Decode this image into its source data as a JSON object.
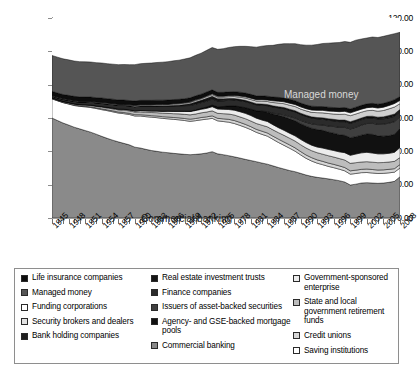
{
  "chart_data": {
    "type": "area",
    "title": "",
    "xlabel": "",
    "ylabel": "",
    "ylim": [
      0,
      120
    ],
    "yticks": [
      "0.00",
      "20.00",
      "40.00",
      "60.00",
      "80.00",
      "100.00",
      "120.00"
    ],
    "grid": false,
    "legend_position": "bottom",
    "stacked": true,
    "x_start": 1945,
    "x_end": 2008,
    "x_tick_step": 3,
    "x_tick_labels": [
      "1945",
      "1948",
      "1951",
      "1954",
      "1957",
      "1960",
      "1963",
      "1966",
      "1969",
      "1972",
      "1975",
      "1978",
      "1981",
      "1984",
      "1987",
      "1990",
      "1993",
      "1996",
      "1999",
      "2002",
      "2005",
      "2008"
    ],
    "x": [
      1945,
      1946,
      1947,
      1948,
      1949,
      1950,
      1951,
      1952,
      1953,
      1954,
      1955,
      1956,
      1957,
      1958,
      1959,
      1960,
      1961,
      1962,
      1963,
      1964,
      1965,
      1966,
      1967,
      1968,
      1969,
      1970,
      1971,
      1972,
      1973,
      1974,
      1975,
      1976,
      1977,
      1978,
      1979,
      1980,
      1981,
      1982,
      1983,
      1984,
      1985,
      1986,
      1987,
      1988,
      1989,
      1990,
      1991,
      1992,
      1993,
      1994,
      1995,
      1996,
      1997,
      1998,
      1999,
      2000,
      2001,
      2002,
      2003,
      2004,
      2005,
      2006,
      2007,
      2008
    ],
    "annotations": [
      {
        "name": "managed-money-label",
        "text": "Managed money"
      },
      {
        "name": "commercial-banking-label",
        "text": "Commercial banking"
      }
    ],
    "series": [
      {
        "name": "Commercial banking",
        "swatch": "#8a8a8a",
        "values": [
          60.0,
          58.5,
          57.0,
          55.8,
          54.5,
          53.5,
          52.5,
          51.5,
          50.3,
          49.0,
          47.8,
          46.7,
          45.7,
          44.8,
          43.9,
          42.5,
          42.0,
          41.2,
          40.5,
          40.0,
          39.5,
          39.2,
          38.8,
          38.5,
          38.2,
          38.0,
          38.2,
          38.5,
          39.0,
          39.8,
          38.5,
          38.0,
          37.4,
          36.7,
          36.0,
          35.2,
          34.5,
          33.8,
          33.0,
          32.3,
          31.3,
          30.3,
          29.4,
          28.5,
          27.8,
          26.8,
          25.8,
          25.0,
          24.4,
          24.0,
          23.5,
          23.0,
          22.4,
          21.6,
          19.8,
          20.3,
          21.0,
          21.2,
          21.0,
          20.8,
          21.0,
          21.4,
          22.0,
          24.8
        ]
      },
      {
        "name": "Saving institutions",
        "swatch": "#ffffff",
        "values": [
          11.5,
          11.8,
          12.2,
          12.6,
          13.0,
          13.5,
          14.2,
          14.8,
          15.4,
          16.0,
          16.6,
          17.0,
          17.3,
          17.8,
          18.2,
          18.7,
          19.2,
          19.6,
          20.0,
          20.2,
          20.3,
          20.3,
          20.4,
          20.4,
          20.3,
          20.0,
          20.2,
          20.4,
          20.3,
          20.0,
          19.8,
          19.9,
          20.1,
          20.0,
          19.6,
          19.2,
          18.5,
          17.6,
          17.2,
          16.8,
          15.9,
          15.0,
          14.2,
          13.4,
          12.3,
          11.1,
          10.0,
          9.2,
          8.5,
          8.0,
          7.5,
          7.2,
          6.9,
          6.7,
          6.5,
          6.4,
          6.2,
          6.1,
          6.0,
          5.9,
          5.8,
          5.7,
          5.5,
          5.2
        ]
      },
      {
        "name": "Credit unions",
        "swatch": "#d6d6d6",
        "values": [
          0.2,
          0.2,
          0.2,
          0.2,
          0.3,
          0.3,
          0.3,
          0.4,
          0.4,
          0.5,
          0.5,
          0.6,
          0.6,
          0.7,
          0.7,
          0.8,
          0.8,
          0.9,
          0.9,
          1.0,
          1.0,
          1.1,
          1.1,
          1.2,
          1.2,
          1.3,
          1.3,
          1.4,
          1.4,
          1.5,
          1.5,
          1.6,
          1.7,
          1.8,
          1.8,
          1.8,
          1.8,
          1.8,
          1.9,
          1.9,
          1.9,
          2.0,
          2.0,
          2.0,
          2.0,
          2.0,
          2.0,
          2.0,
          2.0,
          2.0,
          2.0,
          2.0,
          2.0,
          2.0,
          2.0,
          2.0,
          2.0,
          2.1,
          2.1,
          2.1,
          2.1,
          2.1,
          2.1,
          2.1
        ]
      },
      {
        "name": "State and local government retirement funds",
        "swatch": "#bdbdbd",
        "values": [
          0.4,
          0.4,
          0.5,
          0.5,
          0.6,
          0.6,
          0.7,
          0.8,
          0.9,
          1.0,
          1.1,
          1.2,
          1.3,
          1.4,
          1.5,
          1.6,
          1.7,
          1.8,
          1.9,
          2.0,
          2.1,
          2.2,
          2.3,
          2.4,
          2.5,
          2.6,
          2.7,
          2.8,
          2.9,
          3.0,
          3.0,
          3.1,
          3.2,
          3.3,
          3.3,
          3.4,
          3.4,
          3.5,
          3.6,
          3.7,
          3.8,
          3.9,
          4.0,
          4.0,
          4.1,
          4.1,
          4.2,
          4.2,
          4.3,
          4.3,
          4.4,
          4.4,
          4.4,
          4.5,
          4.5,
          4.5,
          4.4,
          4.4,
          4.4,
          4.4,
          4.4,
          4.4,
          4.4,
          4.2
        ]
      },
      {
        "name": "Government-sponsored enterprise",
        "swatch": "#ececec",
        "values": [
          0.1,
          0.1,
          0.1,
          0.2,
          0.2,
          0.2,
          0.3,
          0.3,
          0.3,
          0.4,
          0.4,
          0.5,
          0.5,
          0.6,
          0.6,
          0.7,
          0.8,
          0.9,
          1.0,
          1.1,
          1.2,
          1.4,
          1.5,
          1.6,
          1.8,
          2.0,
          2.1,
          2.1,
          2.2,
          2.5,
          2.6,
          2.6,
          2.7,
          2.9,
          3.1,
          3.2,
          3.3,
          3.2,
          3.1,
          3.2,
          3.1,
          3.0,
          3.0,
          3.0,
          3.1,
          3.2,
          3.3,
          3.3,
          3.4,
          3.7,
          3.8,
          3.9,
          4.0,
          4.4,
          4.8,
          5.2,
          5.5,
          5.6,
          5.5,
          5.3,
          5.2,
          5.2,
          5.4,
          6.0
        ]
      },
      {
        "name": "Agency- and GSE-backed mortgage pools",
        "swatch": "#111111",
        "values": [
          0.0,
          0.0,
          0.0,
          0.0,
          0.0,
          0.0,
          0.0,
          0.0,
          0.0,
          0.0,
          0.0,
          0.0,
          0.0,
          0.0,
          0.0,
          0.0,
          0.0,
          0.0,
          0.0,
          0.0,
          0.0,
          0.0,
          0.0,
          0.0,
          0.1,
          0.2,
          0.4,
          0.6,
          0.8,
          1.0,
          1.3,
          1.7,
          2.2,
          2.6,
          3.0,
          3.4,
          3.8,
          4.4,
          5.2,
          5.6,
          6.4,
          7.4,
          8.2,
          8.6,
          9.0,
          9.4,
          9.8,
          10.2,
          10.5,
          10.6,
          10.4,
          10.4,
          10.3,
          10.4,
          10.6,
          10.4,
          10.6,
          11.0,
          11.2,
          10.8,
          10.6,
          10.6,
          10.8,
          11.6
        ]
      },
      {
        "name": "Issuers of asset-backed securities",
        "swatch": "#3f3f3f",
        "values": [
          0.0,
          0.0,
          0.0,
          0.0,
          0.0,
          0.0,
          0.0,
          0.0,
          0.0,
          0.0,
          0.0,
          0.0,
          0.0,
          0.0,
          0.0,
          0.0,
          0.0,
          0.0,
          0.0,
          0.0,
          0.0,
          0.0,
          0.0,
          0.0,
          0.0,
          0.0,
          0.0,
          0.0,
          0.0,
          0.0,
          0.0,
          0.0,
          0.0,
          0.0,
          0.0,
          0.0,
          0.0,
          0.1,
          0.2,
          0.3,
          0.5,
          0.8,
          1.1,
          1.4,
          1.7,
          2.0,
          2.3,
          2.6,
          2.9,
          3.2,
          3.6,
          4.0,
          4.4,
          4.8,
          5.2,
          5.6,
          6.0,
          6.3,
          6.6,
          6.9,
          7.2,
          7.5,
          7.6,
          6.8
        ]
      },
      {
        "name": "Finance companies",
        "swatch": "#2b2b2b",
        "values": [
          1.0,
          1.1,
          1.2,
          1.3,
          1.4,
          1.5,
          1.6,
          1.7,
          1.8,
          1.9,
          2.0,
          2.1,
          2.2,
          2.3,
          2.4,
          2.5,
          2.6,
          2.7,
          2.8,
          2.9,
          3.0,
          3.0,
          3.1,
          3.2,
          3.3,
          3.4,
          3.4,
          3.4,
          3.5,
          3.6,
          3.5,
          3.4,
          3.4,
          3.5,
          3.6,
          3.6,
          3.6,
          3.5,
          3.5,
          3.6,
          3.7,
          3.7,
          3.7,
          3.7,
          3.7,
          3.6,
          3.6,
          3.5,
          3.5,
          3.5,
          3.5,
          3.4,
          3.4,
          3.4,
          3.4,
          3.4,
          3.3,
          3.3,
          3.2,
          3.2,
          3.2,
          3.2,
          3.2,
          3.2
        ]
      },
      {
        "name": "Real estate investment trusts",
        "swatch": "#151515",
        "values": [
          0.0,
          0.0,
          0.0,
          0.0,
          0.0,
          0.0,
          0.0,
          0.0,
          0.0,
          0.0,
          0.0,
          0.0,
          0.0,
          0.0,
          0.0,
          0.0,
          0.1,
          0.1,
          0.1,
          0.1,
          0.2,
          0.2,
          0.2,
          0.3,
          0.5,
          0.8,
          1.0,
          1.1,
          1.3,
          1.2,
          1.0,
          0.8,
          0.6,
          0.5,
          0.4,
          0.4,
          0.3,
          0.3,
          0.3,
          0.3,
          0.3,
          0.3,
          0.3,
          0.3,
          0.3,
          0.3,
          0.3,
          0.3,
          0.4,
          0.4,
          0.5,
          0.5,
          0.6,
          0.6,
          0.6,
          0.6,
          0.6,
          0.6,
          0.7,
          0.7,
          0.8,
          0.9,
          0.9,
          0.8
        ]
      },
      {
        "name": "Bank holding companies",
        "swatch": "#1f1f1f",
        "values": [
          0.0,
          0.0,
          0.0,
          0.0,
          0.0,
          0.0,
          0.0,
          0.0,
          0.0,
          0.0,
          0.0,
          0.0,
          0.0,
          0.0,
          0.0,
          0.0,
          0.0,
          0.0,
          0.0,
          0.0,
          0.0,
          0.0,
          0.1,
          0.1,
          0.2,
          0.3,
          0.3,
          0.3,
          0.4,
          0.4,
          0.4,
          0.4,
          0.4,
          0.4,
          0.4,
          0.4,
          0.4,
          0.4,
          0.4,
          0.4,
          0.4,
          0.4,
          0.4,
          0.4,
          0.4,
          0.4,
          0.4,
          0.4,
          0.4,
          0.4,
          0.4,
          0.4,
          0.4,
          0.4,
          0.4,
          0.4,
          0.4,
          0.4,
          0.4,
          0.4,
          0.4,
          0.5,
          0.5,
          0.5
        ]
      },
      {
        "name": "Security brokers and dealers",
        "swatch": "#cfcfcf",
        "values": [
          0.4,
          0.4,
          0.4,
          0.4,
          0.4,
          0.4,
          0.4,
          0.4,
          0.4,
          0.5,
          0.5,
          0.5,
          0.5,
          0.5,
          0.5,
          0.6,
          0.6,
          0.6,
          0.6,
          0.7,
          0.7,
          0.7,
          0.8,
          0.8,
          0.8,
          0.8,
          0.9,
          0.9,
          1.0,
          1.0,
          1.0,
          1.1,
          1.1,
          1.2,
          1.3,
          1.4,
          1.5,
          1.6,
          1.7,
          1.8,
          2.0,
          2.2,
          2.3,
          2.4,
          2.5,
          2.5,
          2.6,
          2.7,
          2.9,
          3.0,
          3.1,
          3.2,
          3.4,
          3.5,
          3.6,
          3.6,
          3.5,
          3.4,
          3.5,
          3.6,
          3.8,
          4.0,
          4.2,
          3.4
        ]
      },
      {
        "name": "Funding corporations",
        "swatch": "#f4f4f4",
        "values": [
          0.1,
          0.1,
          0.1,
          0.1,
          0.1,
          0.1,
          0.1,
          0.1,
          0.1,
          0.1,
          0.1,
          0.1,
          0.1,
          0.1,
          0.1,
          0.2,
          0.2,
          0.2,
          0.2,
          0.2,
          0.2,
          0.2,
          0.3,
          0.3,
          0.3,
          0.3,
          0.4,
          0.4,
          0.4,
          0.5,
          0.5,
          0.5,
          0.6,
          0.6,
          0.7,
          0.7,
          0.8,
          0.8,
          0.9,
          0.9,
          1.0,
          1.1,
          1.1,
          1.2,
          1.2,
          1.3,
          1.3,
          1.4,
          1.4,
          1.5,
          1.5,
          1.6,
          1.6,
          1.7,
          1.7,
          1.8,
          1.8,
          1.8,
          1.9,
          1.9,
          2.0,
          2.0,
          2.1,
          2.0
        ]
      },
      {
        "name": "Life insurance companies",
        "swatch": "#0d0d0d",
        "values": [
          2.3,
          2.4,
          2.4,
          2.5,
          2.5,
          2.6,
          2.6,
          2.6,
          2.6,
          2.6,
          2.6,
          2.6,
          2.6,
          2.6,
          2.6,
          2.6,
          2.6,
          2.6,
          2.6,
          2.5,
          2.5,
          2.5,
          2.5,
          2.4,
          2.4,
          2.4,
          2.4,
          2.4,
          2.4,
          2.4,
          2.3,
          2.3,
          2.3,
          2.3,
          2.3,
          2.3,
          2.3,
          2.3,
          2.3,
          2.3,
          2.3,
          2.3,
          2.3,
          2.3,
          2.3,
          2.3,
          2.3,
          2.3,
          2.3,
          2.3,
          2.3,
          2.3,
          2.3,
          2.3,
          2.3,
          2.3,
          2.3,
          2.3,
          2.3,
          2.3,
          2.3,
          2.3,
          2.3,
          2.3
        ]
      },
      {
        "name": "Managed money",
        "swatch": "#555555",
        "values": [
          21.5,
          21.5,
          21.4,
          21.3,
          21.2,
          21.1,
          21.0,
          21.0,
          21.0,
          21.0,
          21.0,
          21.0,
          21.2,
          21.3,
          21.5,
          21.8,
          22.0,
          22.2,
          22.4,
          22.6,
          22.8,
          23.0,
          23.2,
          23.5,
          23.8,
          24.0,
          24.3,
          24.6,
          25.0,
          25.4,
          25.8,
          26.2,
          26.6,
          27.0,
          27.5,
          28.0,
          28.6,
          29.2,
          29.8,
          30.4,
          31.0,
          31.8,
          32.6,
          33.4,
          34.2,
          35.0,
          35.8,
          36.6,
          37.2,
          37.8,
          38.4,
          38.8,
          39.2,
          39.6,
          40.0,
          40.2,
          39.8,
          39.5,
          39.8,
          40.0,
          40.2,
          40.0,
          39.6,
          38.5
        ]
      }
    ]
  },
  "legend": {
    "columns": [
      {
        "name": "legend-column-1",
        "items": [
          {
            "label": "Life insurance companies",
            "color": "#0d0d0d"
          },
          {
            "label": "Managed money",
            "color": "#555555"
          },
          {
            "label": "Funding corporations",
            "color": "#ffffff"
          },
          {
            "label": "Security brokers and dealers",
            "color": "#e2e2e2"
          },
          {
            "label": "Bank holding companies",
            "color": "#1f1f1f"
          }
        ]
      },
      {
        "name": "legend-column-2",
        "items": [
          {
            "label": "Real estate investment trusts",
            "color": "#151515"
          },
          {
            "label": "Finance companies",
            "color": "#2b2b2b"
          },
          {
            "label": "Issuers of asset-backed securities",
            "color": "#3f3f3f"
          },
          {
            "label": "Agency- and GSE-backed mortgage pools",
            "color": "#111111"
          },
          {
            "label": "Commercial banking",
            "color": "#8a8a8a"
          }
        ]
      },
      {
        "name": "legend-column-3",
        "items": [
          {
            "label": "Government-sponsored enterprise",
            "color": "#ececec"
          },
          {
            "label": "State and local government retirement funds",
            "color": "#bdbdbd"
          },
          {
            "label": "Credit unions",
            "color": "#d6d6d6"
          },
          {
            "label": "Saving institutions",
            "color": "#ffffff"
          }
        ]
      }
    ]
  }
}
